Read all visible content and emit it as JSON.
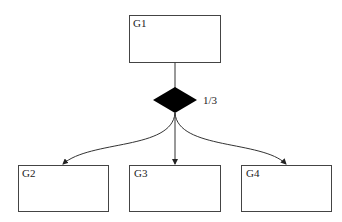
{
  "diagram": {
    "nodes": [
      {
        "id": "G1",
        "label": "G1"
      },
      {
        "id": "G2",
        "label": "G2"
      },
      {
        "id": "G3",
        "label": "G3"
      },
      {
        "id": "G4",
        "label": "G4"
      }
    ],
    "junction": {
      "type": "diamond",
      "label": "1/3",
      "fill": "#000000"
    },
    "edges": [
      {
        "from": "G1",
        "to": "junction"
      },
      {
        "from": "junction",
        "to": "G2"
      },
      {
        "from": "junction",
        "to": "G3"
      },
      {
        "from": "junction",
        "to": "G4"
      }
    ]
  }
}
